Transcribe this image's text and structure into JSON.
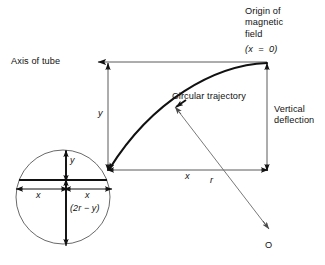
{
  "figure": {
    "title_present": false,
    "labels": {
      "origin_of_field": "Origin of\nmagnetic\nfield",
      "x_equals_zero": "(x  =  0)",
      "axis_of_tube": "Axis of tube",
      "circular_trajectory": "Circular trajectory",
      "vertical_deflection": "Vertical\ndeflection",
      "y_deflection": "y",
      "x_horizontal": "x",
      "radius": "r",
      "center_point": "O",
      "inset_y": "y",
      "inset_x_left": "x",
      "inset_x_right": "x",
      "inset_two_r_minus_y": "(2r − y)"
    },
    "colors": {
      "stroke": "#111111",
      "thin_stroke": "#5a5a5a",
      "background": "#ffffff",
      "text": "#111111"
    },
    "geometry": {
      "origin_point": [
        267,
        62
      ],
      "trajectory_start": [
        108,
        170
      ],
      "center_O": [
        268,
        228
      ],
      "inset_circle_center": [
        63,
        197
      ],
      "inset_circle_radius": 47
    }
  }
}
